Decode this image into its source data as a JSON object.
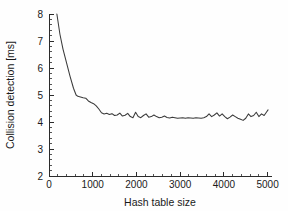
{
  "chart_data": {
    "type": "line",
    "title": "",
    "xlabel": "Hash table size",
    "ylabel": "Collision detection [ms]",
    "xlim": [
      0,
      5100
    ],
    "ylim": [
      2,
      8
    ],
    "grid": false,
    "legend": null,
    "xticks": [
      0,
      1000,
      2000,
      3000,
      4000,
      5000
    ],
    "xtick_labels": [
      "0",
      "1000",
      "2000",
      "3000",
      "4000",
      "5000"
    ],
    "x_minor_step": 200,
    "yticks": [
      2,
      3,
      4,
      5,
      6,
      7,
      8
    ],
    "ytick_labels": [
      "2",
      "3",
      "4",
      "5",
      "6",
      "7",
      "8"
    ],
    "y_minor_step": 0.2,
    "line_color": "#3a3a3a",
    "axis_color": "#2b2b2b",
    "series": [
      {
        "name": "collision detection time",
        "x": [
          180,
          250,
          320,
          400,
          480,
          560,
          620,
          660,
          720,
          780,
          840,
          900,
          960,
          1020,
          1080,
          1140,
          1200,
          1260,
          1320,
          1380,
          1440,
          1500,
          1560,
          1620,
          1680,
          1740,
          1800,
          1860,
          1920,
          1980,
          2040,
          2100,
          2160,
          2220,
          2280,
          2340,
          2400,
          2460,
          2520,
          2580,
          2640,
          2700,
          2760,
          2820,
          2880,
          2940,
          3000,
          3060,
          3120,
          3180,
          3240,
          3300,
          3360,
          3420,
          3480,
          3540,
          3600,
          3660,
          3720,
          3780,
          3840,
          3900,
          3960,
          4020,
          4080,
          4140,
          4200,
          4260,
          4320,
          4380,
          4440,
          4500,
          4560,
          4620,
          4680,
          4740,
          4800,
          4860,
          4920,
          4980,
          5010
        ],
        "y": [
          8.0,
          7.25,
          6.7,
          6.2,
          5.7,
          5.25,
          5.0,
          4.95,
          4.93,
          4.9,
          4.88,
          4.78,
          4.72,
          4.68,
          4.6,
          4.48,
          4.34,
          4.3,
          4.32,
          4.28,
          4.31,
          4.24,
          4.26,
          4.33,
          4.22,
          4.25,
          4.32,
          4.2,
          4.16,
          4.36,
          4.2,
          4.16,
          4.24,
          4.3,
          4.18,
          4.2,
          4.26,
          4.2,
          4.16,
          4.18,
          4.22,
          4.17,
          4.15,
          4.18,
          4.16,
          4.14,
          4.15,
          4.16,
          4.14,
          4.16,
          4.15,
          4.14,
          4.16,
          4.15,
          4.14,
          4.16,
          4.2,
          4.3,
          4.2,
          4.26,
          4.34,
          4.22,
          4.3,
          4.2,
          4.12,
          4.18,
          4.26,
          4.2,
          4.14,
          4.1,
          4.06,
          4.14,
          4.3,
          4.2,
          4.24,
          4.36,
          4.2,
          4.3,
          4.24,
          4.38,
          4.45
        ]
      }
    ]
  }
}
